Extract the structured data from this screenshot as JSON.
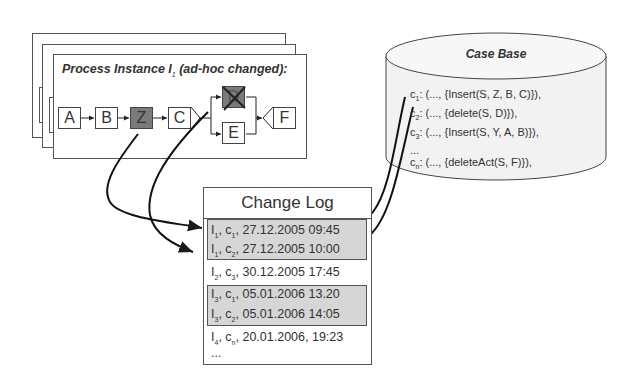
{
  "process_instance": {
    "title_prefix": "Process Instance I",
    "title_subscript": "1",
    "title_suffix": " (ad-hoc changed):",
    "nodes": [
      {
        "id": "A",
        "label": "A",
        "state": "normal"
      },
      {
        "id": "B",
        "label": "B",
        "state": "normal"
      },
      {
        "id": "Z",
        "label": "Z",
        "state": "inserted"
      },
      {
        "id": "C",
        "label": "C",
        "state": "normal"
      },
      {
        "id": "D",
        "label": "D",
        "state": "deleted"
      },
      {
        "id": "E",
        "label": "E",
        "state": "normal"
      },
      {
        "id": "F",
        "label": "F",
        "state": "normal"
      }
    ]
  },
  "case_base": {
    "title": "Case Base",
    "cases": [
      {
        "name": "c",
        "sub": "1",
        "text": ": (..., {Insert(S, Z, B, C)}),"
      },
      {
        "name": "c",
        "sub": "2",
        "text": ": (..., {delete(S, D)}),"
      },
      {
        "name": "c",
        "sub": "3",
        "text": ": (..., {Insert(S, Y, A, B)}),"
      },
      {
        "name": "",
        "sub": "",
        "text": "..."
      },
      {
        "name": "c",
        "sub": "n",
        "text": ": (..., {deleteAct(S, F)}),"
      }
    ]
  },
  "change_log": {
    "title": "Change Log",
    "entries": [
      {
        "inst": "I",
        "inst_sub": "1",
        "case": "c",
        "case_sub": "1",
        "time": ", 27.12.2005 09:45",
        "highlight_group": 1
      },
      {
        "inst": "I",
        "inst_sub": "1",
        "case": "c",
        "case_sub": "2",
        "time": ", 27.12.2005 10:00",
        "highlight_group": 1
      },
      {
        "inst": "I",
        "inst_sub": "2",
        "case": "c",
        "case_sub": "3",
        "time": ", 30.12.2005 17:45",
        "highlight_group": null
      },
      {
        "inst": "I",
        "inst_sub": "3",
        "case": "c",
        "case_sub": "1",
        "time": ", 05.01.2006 13.20",
        "highlight_group": 2
      },
      {
        "inst": "I",
        "inst_sub": "3",
        "case": "c",
        "case_sub": "2",
        "time": ", 05.01.2006 14:05",
        "highlight_group": 2
      },
      {
        "inst": "I",
        "inst_sub": "4",
        "case": "c",
        "case_sub": "n",
        "time": ", 20.01.2006, 19:23",
        "highlight_group": null
      }
    ],
    "ellipsis": "..."
  },
  "colors": {
    "highlight": "#d6d6d6",
    "changed_node": "#7a7a7a",
    "line": "#1a1a1a",
    "cylinder_fill": "#f2f2f2"
  }
}
